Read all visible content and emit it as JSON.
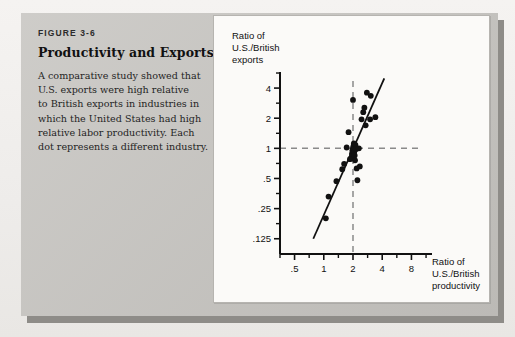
{
  "figure": {
    "number": "FIGURE 3-6",
    "title": "Productivity and Exports",
    "body_lines": [
      "A comparative study showed that",
      "U.S. exports were high relative",
      "to British exports in industries in",
      "which the United States had high",
      "relative labor productivity. Each",
      "dot represents a different industry."
    ]
  },
  "colors": {
    "panel_gray": "#c6c4c0",
    "panel_shadow": "#8e8c88",
    "chart_bg": "#fbfaf8",
    "ink": "#111111",
    "dashed_gray": "#8a8a8a"
  },
  "chart_data": {
    "type": "scatter",
    "title": "",
    "xlabel_lines": [
      "Ratio of",
      "U.S./British",
      "productivity"
    ],
    "ylabel_lines": [
      "Ratio of",
      "U.S./British",
      "exports"
    ],
    "xscale": "log",
    "yscale": "log",
    "xlim": [
      0.354,
      11.3
    ],
    "ylim": [
      0.088,
      5.66
    ],
    "xticks_major": [
      0.5,
      1,
      2,
      4,
      8
    ],
    "xticklabels": [
      ".5",
      "1",
      "2",
      "4",
      "8"
    ],
    "xticks_minor": [
      0.354,
      0.707,
      1.414,
      2.828,
      5.657,
      11.314
    ],
    "yticks_major": [
      0.125,
      0.25,
      0.5,
      1,
      2,
      4
    ],
    "yticklabels": [
      ".125",
      ".25",
      ".5",
      "1",
      "2",
      "4"
    ],
    "yticks_minor": [
      0.177,
      0.354,
      0.707,
      1.414,
      2.828,
      5.657
    ],
    "grid": false,
    "legend": null,
    "reference_lines": [
      {
        "name": "vertical-dashed",
        "orientation": "vertical",
        "x": 2.0,
        "style": "dashed"
      },
      {
        "name": "horizontal-dashed",
        "orientation": "horizontal",
        "y": 1.0,
        "style": "dashed"
      }
    ],
    "fit_line": {
      "name": "regression-line",
      "x0": 0.78,
      "y0": 0.125,
      "x1": 4.2,
      "y1": 5.0
    },
    "points": [
      {
        "x": 1.05,
        "y": 0.2
      },
      {
        "x": 1.12,
        "y": 0.33
      },
      {
        "x": 1.35,
        "y": 0.47
      },
      {
        "x": 1.55,
        "y": 0.62
      },
      {
        "x": 1.62,
        "y": 0.7
      },
      {
        "x": 1.72,
        "y": 1.02
      },
      {
        "x": 1.86,
        "y": 0.78
      },
      {
        "x": 1.92,
        "y": 0.8
      },
      {
        "x": 1.95,
        "y": 0.88
      },
      {
        "x": 1.97,
        "y": 0.95
      },
      {
        "x": 2.0,
        "y": 1.0
      },
      {
        "x": 2.02,
        "y": 1.05
      },
      {
        "x": 2.04,
        "y": 1.12
      },
      {
        "x": 2.06,
        "y": 0.92
      },
      {
        "x": 2.08,
        "y": 0.85
      },
      {
        "x": 2.1,
        "y": 0.76
      },
      {
        "x": 2.12,
        "y": 1.08
      },
      {
        "x": 2.14,
        "y": 0.98
      },
      {
        "x": 2.18,
        "y": 0.63
      },
      {
        "x": 2.22,
        "y": 0.48
      },
      {
        "x": 2.3,
        "y": 1.0
      },
      {
        "x": 2.35,
        "y": 0.66
      },
      {
        "x": 2.0,
        "y": 3.05
      },
      {
        "x": 2.45,
        "y": 1.95
      },
      {
        "x": 2.55,
        "y": 2.3
      },
      {
        "x": 2.62,
        "y": 2.55
      },
      {
        "x": 2.7,
        "y": 1.7
      },
      {
        "x": 2.78,
        "y": 3.6
      },
      {
        "x": 3.0,
        "y": 1.95
      },
      {
        "x": 3.05,
        "y": 3.35
      },
      {
        "x": 3.4,
        "y": 2.05
      },
      {
        "x": 1.8,
        "y": 1.45
      }
    ]
  }
}
